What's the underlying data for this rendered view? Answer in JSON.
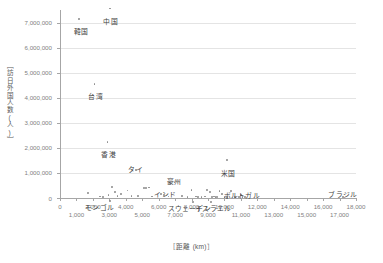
{
  "chart_data": {
    "type": "scatter",
    "title": "",
    "xlabel": "［距離 (km)］",
    "ylabel": "［訪日外国人数(人)］",
    "xlim": [
      0,
      18000
    ],
    "ylim": [
      0,
      7500000
    ],
    "grid": "horizontal",
    "legend": "none",
    "x_ticks": [
      0,
      1000,
      2000,
      3000,
      4000,
      5000,
      6000,
      7000,
      8000,
      9000,
      10000,
      11000,
      12000,
      13000,
      14000,
      15000,
      16000,
      17000,
      18000
    ],
    "x_tick_labels": [
      "0",
      "1,000",
      "2,000",
      "3,000",
      "4,000",
      "5,000",
      "6,000",
      "7,000",
      "8,000",
      "9,000",
      "10,000",
      "11,000",
      "12,000",
      "13,000",
      "14,000",
      "15,000",
      "16,000",
      "17,000",
      "18,000"
    ],
    "y_ticks": [
      0,
      1000000,
      2000000,
      3000000,
      4000000,
      5000000,
      6000000,
      7000000
    ],
    "y_tick_labels": [
      "0",
      "1,000,000",
      "2,000,000",
      "3,000,000",
      "4,000,000",
      "5,000,000",
      "6,000,000",
      "7,000,000"
    ],
    "points": [
      {
        "label": "韓国",
        "x": 1160,
        "y": 7140000,
        "label_dx": 2,
        "label_dy": 9
      },
      {
        "label": "中国",
        "x": 3020,
        "y": 7560000,
        "label_dx": 1,
        "label_dy": 10
      },
      {
        "label": "台湾",
        "x": 2100,
        "y": 4560000,
        "label_dx": 1,
        "label_dy": 9
      },
      {
        "label": "香港",
        "x": 2890,
        "y": 2230000,
        "label_dx": 1,
        "label_dy": 9
      },
      {
        "label": "タイ",
        "x": 4600,
        "y": 1130000,
        "label_dx": 0,
        "label_dy": -4
      },
      {
        "label": "米国",
        "x": 10160,
        "y": 1520000,
        "label_dx": 1,
        "label_dy": 10
      },
      {
        "label": "豪州",
        "x": 6960,
        "y": 620000,
        "label_dx": 0,
        "label_dy": -4
      },
      {
        "label": "インド",
        "x": 6150,
        "y": 175000,
        "label_dx": 4,
        "label_dy": -3
      },
      {
        "label": "モンゴル",
        "x": 3020,
        "y": -120000,
        "label_dx": -10,
        "label_dy": 3
      },
      {
        "label": "スウェーデン",
        "x": 8100,
        "y": -150000,
        "label_dx": -4,
        "label_dy": 3
      },
      {
        "label": "イスラエル",
        "x": 9200,
        "y": -150000,
        "label_dx": 2,
        "label_dy": 3
      },
      {
        "label": "ポルトガル",
        "x": 11000,
        "y": 120000,
        "label_dx": 1,
        "label_dy": -3
      },
      {
        "label": "ブラジル",
        "x": 17200,
        "y": 40000,
        "label_dx": 0,
        "label_dy": -6
      }
    ],
    "unlabeled_points": [
      {
        "x": 1700,
        "y": 195000
      },
      {
        "x": 2450,
        "y": 60000
      },
      {
        "x": 2600,
        "y": 40000
      },
      {
        "x": 2950,
        "y": 120000
      },
      {
        "x": 3150,
        "y": 440000
      },
      {
        "x": 3350,
        "y": 230000
      },
      {
        "x": 3500,
        "y": 70000
      },
      {
        "x": 3700,
        "y": 150000
      },
      {
        "x": 4100,
        "y": 300000
      },
      {
        "x": 4350,
        "y": 80000
      },
      {
        "x": 4750,
        "y": 95000
      },
      {
        "x": 5100,
        "y": 415000
      },
      {
        "x": 5250,
        "y": 390000
      },
      {
        "x": 5400,
        "y": 420000
      },
      {
        "x": 5600,
        "y": 60000
      },
      {
        "x": 6300,
        "y": 120000
      },
      {
        "x": 6600,
        "y": 60000
      },
      {
        "x": 7400,
        "y": 90000
      },
      {
        "x": 7750,
        "y": 50000
      },
      {
        "x": 8000,
        "y": 330000
      },
      {
        "x": 8250,
        "y": 60000
      },
      {
        "x": 8400,
        "y": 55000
      },
      {
        "x": 8600,
        "y": 50000
      },
      {
        "x": 8800,
        "y": 60000
      },
      {
        "x": 8950,
        "y": 330000
      },
      {
        "x": 9100,
        "y": 250000
      },
      {
        "x": 9250,
        "y": 45000
      },
      {
        "x": 9350,
        "y": 60000
      },
      {
        "x": 9450,
        "y": 45000
      },
      {
        "x": 9550,
        "y": 40000
      },
      {
        "x": 9700,
        "y": 280000
      },
      {
        "x": 9850,
        "y": 170000
      },
      {
        "x": 10000,
        "y": 45000
      },
      {
        "x": 10150,
        "y": 40000
      },
      {
        "x": 10400,
        "y": 290000
      },
      {
        "x": 10650,
        "y": 55000
      },
      {
        "x": 10900,
        "y": 45000
      },
      {
        "x": 11100,
        "y": 35000
      },
      {
        "x": 11250,
        "y": 30000
      }
    ]
  }
}
